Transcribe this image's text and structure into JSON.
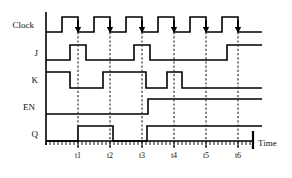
{
  "diagram": {
    "axis": {
      "time_label": "Time",
      "origin_x": 46,
      "end_x": 253,
      "unit_px": 32,
      "minor_tick_px": 4
    },
    "markers": [
      {
        "name": "t1",
        "label": "t1",
        "x": 78
      },
      {
        "name": "t2",
        "label": "t2",
        "x": 110
      },
      {
        "name": "t3",
        "label": "t3",
        "x": 142
      },
      {
        "name": "t4",
        "label": "t4",
        "x": 174
      },
      {
        "name": "t5",
        "label": "t5",
        "x": 206
      },
      {
        "name": "t6",
        "label": "t6",
        "x": 238
      }
    ],
    "signals": [
      {
        "name": "clock",
        "label": "Clock",
        "label_x": 34,
        "baseline_y": 32,
        "high_y": 17,
        "active_edge": "falling",
        "segments": [
          {
            "t": 46,
            "v": 0
          },
          {
            "t": 62,
            "v": 1
          },
          {
            "t": 78,
            "v": 0
          },
          {
            "t": 94,
            "v": 1
          },
          {
            "t": 110,
            "v": 0
          },
          {
            "t": 126,
            "v": 1
          },
          {
            "t": 142,
            "v": 0
          },
          {
            "t": 158,
            "v": 1
          },
          {
            "t": 174,
            "v": 0
          },
          {
            "t": 190,
            "v": 1
          },
          {
            "t": 206,
            "v": 0
          },
          {
            "t": 222,
            "v": 1
          },
          {
            "t": 238,
            "v": 0
          },
          {
            "t": 262,
            "v": 0
          }
        ],
        "arrows": [
          78,
          110,
          142,
          174,
          206,
          238
        ]
      },
      {
        "name": "j",
        "label": "J",
        "label_x": 38,
        "baseline_y": 60,
        "high_y": 45,
        "segments": [
          {
            "t": 46,
            "v": 0
          },
          {
            "t": 70,
            "v": 1
          },
          {
            "t": 86,
            "v": 0
          },
          {
            "t": 134,
            "v": 1
          },
          {
            "t": 150,
            "v": 0
          },
          {
            "t": 227,
            "v": 1
          },
          {
            "t": 262,
            "v": 1
          }
        ],
        "arrows": []
      },
      {
        "name": "k",
        "label": "K",
        "label_x": 38,
        "baseline_y": 88,
        "high_y": 72,
        "segments": [
          {
            "t": 46,
            "v": 1
          },
          {
            "t": 70,
            "v": 0
          },
          {
            "t": 103,
            "v": 1
          },
          {
            "t": 146,
            "v": 0
          },
          {
            "t": 167,
            "v": 1
          },
          {
            "t": 182,
            "v": 0
          },
          {
            "t": 262,
            "v": 0
          }
        ],
        "arrows": []
      },
      {
        "name": "en",
        "label": "EN",
        "label_x": 35,
        "baseline_y": 114,
        "high_y": 99,
        "segments": [
          {
            "t": 46,
            "v": 0
          },
          {
            "t": 148,
            "v": 1
          },
          {
            "t": 262,
            "v": 1
          }
        ],
        "arrows": []
      },
      {
        "name": "q",
        "label": "Q",
        "label_x": 38,
        "baseline_y": 141,
        "high_y": 126,
        "segments": [
          {
            "t": 46,
            "v": 0
          },
          {
            "t": 78,
            "v": 1
          },
          {
            "t": 113,
            "v": 0
          },
          {
            "t": 147,
            "v": 1
          },
          {
            "t": 253,
            "v": 1
          },
          {
            "t": 262,
            "v": 1
          }
        ],
        "arrows": []
      }
    ],
    "vertical_axis": {
      "x": 46,
      "y_top": 12,
      "y_bottom": 145
    },
    "marker_span": {
      "y_top": 32,
      "y_bottom": 147
    },
    "time_label_pos": {
      "x": 258,
      "y": 146
    }
  }
}
